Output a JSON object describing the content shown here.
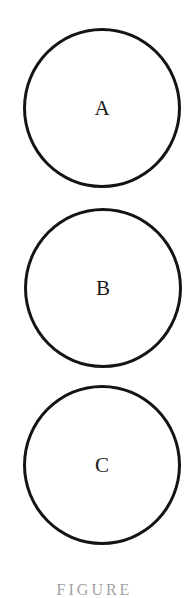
{
  "diagram": {
    "circles": [
      {
        "label": "A"
      },
      {
        "label": "B"
      },
      {
        "label": "C"
      }
    ],
    "stroke_color": "#141414",
    "background_color": "#ffffff"
  },
  "caption": {
    "text": "FIGURE"
  }
}
